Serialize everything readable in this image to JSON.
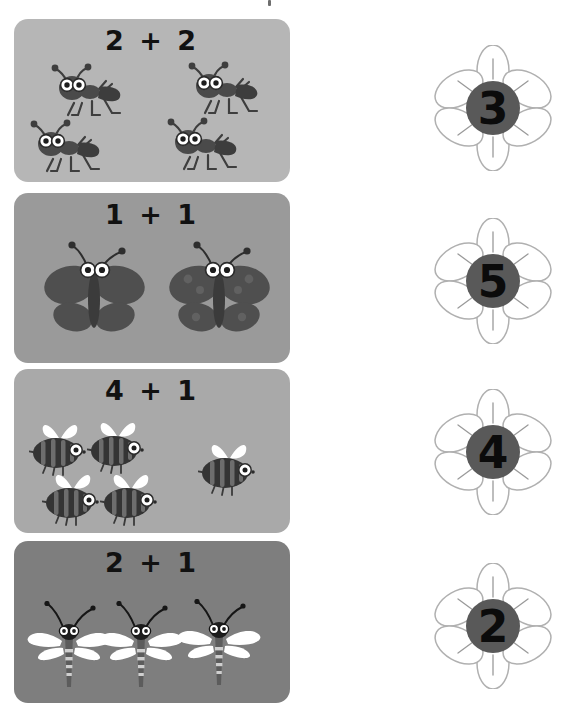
{
  "worksheet": {
    "title": "Addition with insects matching worksheet",
    "background_color": "#ffffff"
  },
  "problems": [
    {
      "id": "problem-1",
      "equation": "2 + 2",
      "addend_left": 2,
      "addend_right": 2,
      "answer": 4,
      "insect": "ant",
      "insect_count": 4,
      "card_color": "#b6b6b6",
      "top": 19,
      "height": 163
    },
    {
      "id": "problem-2",
      "equation": "1 + 1",
      "addend_left": 1,
      "addend_right": 1,
      "answer": 2,
      "insect": "butterfly",
      "insect_count": 2,
      "card_color": "#9a9a9a",
      "top": 193,
      "height": 170
    },
    {
      "id": "problem-3",
      "equation": "4 + 1",
      "addend_left": 4,
      "addend_right": 1,
      "answer": 5,
      "insect": "bee",
      "insect_count": 5,
      "card_color": "#a9a9a9",
      "top": 369,
      "height": 164
    },
    {
      "id": "problem-4",
      "equation": "2 + 1",
      "addend_left": 2,
      "addend_right": 1,
      "answer": 3,
      "insect": "dragonfly",
      "insect_count": 3,
      "card_color": "#7e7e7e",
      "top": 541,
      "height": 162
    }
  ],
  "answer_flowers": [
    {
      "id": "flower-3",
      "number": "3",
      "top": 45,
      "center_color": "#595959",
      "petal_fill": "#ffffff",
      "petal_stroke": "#b0b0b0"
    },
    {
      "id": "flower-5",
      "number": "5",
      "top": 218,
      "center_color": "#595959",
      "petal_fill": "#ffffff",
      "petal_stroke": "#b0b0b0"
    },
    {
      "id": "flower-4",
      "number": "4",
      "top": 389,
      "center_color": "#595959",
      "petal_fill": "#ffffff",
      "petal_stroke": "#b0b0b0"
    },
    {
      "id": "flower-2",
      "number": "2",
      "top": 563,
      "center_color": "#595959",
      "petal_fill": "#ffffff",
      "petal_stroke": "#b0b0b0"
    }
  ],
  "colors": {
    "ink": "#111111",
    "flower_center": "#595959",
    "flower_outline": "#b0b0b0",
    "page_background": "#ffffff"
  }
}
